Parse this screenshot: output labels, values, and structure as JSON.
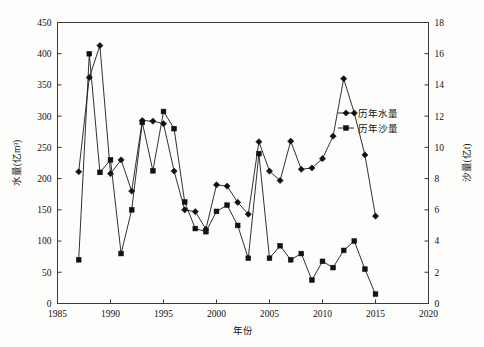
{
  "chart_data": {
    "type": "line",
    "title": "",
    "xlabel": "年份",
    "ylabel": "水量(亿m³)",
    "y2label": "沙量(亿t)",
    "xlim": [
      1985,
      2020
    ],
    "ylim": [
      0,
      450
    ],
    "y2lim": [
      0,
      18
    ],
    "xticks": [
      1985,
      1990,
      1995,
      2000,
      2005,
      2010,
      2015,
      2020
    ],
    "yticks": [
      0,
      50,
      100,
      150,
      200,
      250,
      300,
      350,
      400,
      450
    ],
    "y2ticks": [
      0,
      2,
      4,
      6,
      8,
      10,
      12,
      14,
      16,
      18
    ],
    "grid": false,
    "legend_position": "center-right",
    "x": [
      1987,
      1988,
      1989,
      1990,
      1991,
      1992,
      1993,
      1994,
      1995,
      1996,
      1997,
      1998,
      1999,
      2000,
      2001,
      2002,
      2003,
      2004,
      2005,
      2006,
      2007,
      2008,
      2009,
      2010,
      2011,
      2012,
      2013,
      2014,
      2015
    ],
    "series": [
      {
        "name": "历年水量",
        "axis": "left",
        "unit": "亿m³",
        "marker": "diamond",
        "values": [
          211,
          362,
          413,
          208,
          230,
          180,
          293,
          292,
          288,
          212,
          150,
          147,
          119,
          190,
          188,
          162,
          143,
          259,
          212,
          197,
          260,
          215,
          217,
          232,
          268,
          360,
          305,
          238,
          140
        ]
      },
      {
        "name": "历年沙量",
        "axis": "right",
        "unit": "亿t",
        "marker": "square",
        "values": [
          2.8,
          16.0,
          8.4,
          9.2,
          3.2,
          6.0,
          11.6,
          8.5,
          12.3,
          11.2,
          6.5,
          4.8,
          4.6,
          5.9,
          6.3,
          5.0,
          2.9,
          9.6,
          2.9,
          3.7,
          2.8,
          3.2,
          1.5,
          2.7,
          2.3,
          3.4,
          4.0,
          2.2,
          0.6
        ]
      }
    ]
  },
  "legend": {
    "items": [
      {
        "label": "历年水量",
        "marker": "diamond"
      },
      {
        "label": "历年沙量",
        "marker": "square"
      }
    ]
  },
  "axis_titles": {
    "x": "年份",
    "y_left": "水量(亿m³)",
    "y_right": "沙量(亿t)"
  }
}
